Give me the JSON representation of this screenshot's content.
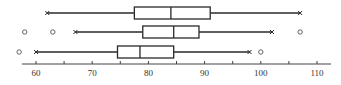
{
  "chart_data": {
    "type": "boxplot",
    "orientation": "horizontal",
    "title": "",
    "xlabel": "",
    "ylabel": "",
    "xlim": [
      57,
      112
    ],
    "xticks_major": [
      60,
      70,
      80,
      90,
      100,
      110
    ],
    "xticks_minor": [
      65,
      75,
      85,
      95,
      105
    ],
    "tick_labels": [
      "60",
      "70",
      "80",
      "90",
      "100",
      "110"
    ],
    "grid": false,
    "legend": null,
    "series": [
      {
        "name": "row-1",
        "whisker_low": 62,
        "q1": 77.5,
        "median": 84,
        "q3": 91,
        "whisker_high": 107,
        "outliers": []
      },
      {
        "name": "row-2",
        "whisker_low": 67,
        "q1": 79,
        "median": 84.5,
        "q3": 89,
        "whisker_high": 102,
        "outliers": [
          58,
          63,
          107
        ]
      },
      {
        "name": "row-3",
        "whisker_low": 60,
        "q1": 74.5,
        "median": 78.5,
        "q3": 84.5,
        "whisker_high": 98,
        "outliers": [
          57,
          100
        ]
      }
    ],
    "colors": {
      "line": "#2a2a2a",
      "axis": "#444444",
      "outlier": "#555555"
    }
  }
}
